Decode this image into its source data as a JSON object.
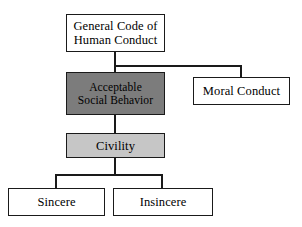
{
  "diagram": {
    "type": "hierarchy-tree",
    "title": "",
    "colors": {
      "background": "#ffffff",
      "stroke": "#1a1a1a",
      "node_white": "#ffffff",
      "node_dark_gray": "#7c7c7c",
      "node_light_gray": "#c6c6c6",
      "text": "#000000"
    },
    "nodes": [
      {
        "id": "general-code-of-human-conduct",
        "label": "General Code of\nHuman Conduct",
        "fill": "white",
        "level": 0
      },
      {
        "id": "acceptable-social-behavior",
        "label": "Acceptable\nSocial Behavior",
        "fill": "dark",
        "level": 1
      },
      {
        "id": "moral-conduct",
        "label": "Moral Conduct",
        "fill": "white",
        "level": 1
      },
      {
        "id": "civility",
        "label": "Civility",
        "fill": "light",
        "level": 2
      },
      {
        "id": "sincere",
        "label": "Sincere",
        "fill": "white",
        "level": 3
      },
      {
        "id": "insincere",
        "label": "Insincere",
        "fill": "white",
        "level": 3
      }
    ],
    "edges": [
      {
        "from": "general-code-of-human-conduct",
        "to": "acceptable-social-behavior"
      },
      {
        "from": "general-code-of-human-conduct",
        "to": "moral-conduct"
      },
      {
        "from": "acceptable-social-behavior",
        "to": "civility"
      },
      {
        "from": "civility",
        "to": "sincere"
      },
      {
        "from": "civility",
        "to": "insincere"
      }
    ]
  }
}
